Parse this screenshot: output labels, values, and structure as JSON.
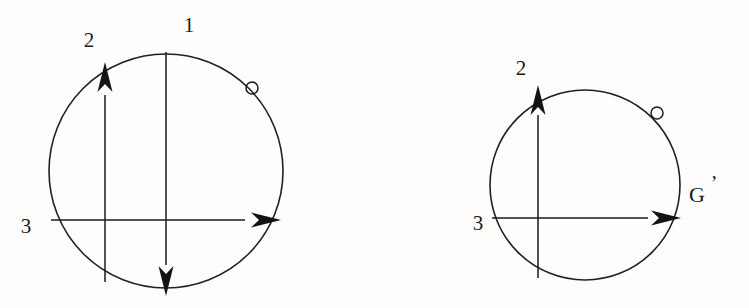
{
  "figure": {
    "background_color": "#fdfdfc",
    "ink_color": "#1c1a1a",
    "diagrams": [
      {
        "name": "original-frame",
        "frame_label": "",
        "circle": {
          "cx": 166,
          "cy": 171,
          "r": 117
        },
        "axes": [
          {
            "label": "1",
            "name": "axis-1",
            "orientation": "vertical",
            "direction": "down",
            "label_x": 189,
            "label_y": 32
          },
          {
            "label": "2",
            "name": "axis-2",
            "orientation": "vertical",
            "direction": "up",
            "label_x": 89,
            "label_y": 47
          },
          {
            "label": "3",
            "name": "axis-3",
            "orientation": "horizontal",
            "direction": "right",
            "label_x": 26,
            "label_y": 233
          }
        ],
        "marker": {
          "name": "pole-marker",
          "cx": 252,
          "cy": 88,
          "r": 6
        }
      },
      {
        "name": "rotated-frame",
        "frame_label": "G",
        "frame_label_prime": "’",
        "circle": {
          "cx": 585,
          "cy": 185,
          "r": 95
        },
        "axes": [
          {
            "label": "2",
            "name": "axis-2",
            "orientation": "vertical",
            "direction": "up",
            "label_x": 521,
            "label_y": 75
          },
          {
            "label": "3",
            "name": "axis-3",
            "orientation": "horizontal",
            "direction": "right",
            "label_x": 478,
            "label_y": 230
          }
        ],
        "marker": {
          "name": "pole-marker",
          "cx": 657,
          "cy": 113,
          "r": 6
        }
      }
    ]
  }
}
